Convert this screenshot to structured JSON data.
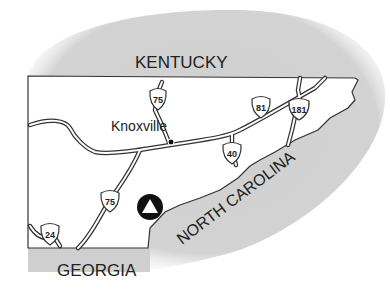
{
  "map": {
    "states": {
      "north": "KENTUCKY",
      "south": "GEORGIA",
      "east": "NORTH CAROLINA"
    },
    "city": {
      "name": "Knoxville"
    },
    "highways": [
      {
        "id": "i75-north",
        "number": "75"
      },
      {
        "id": "i81",
        "number": "81"
      },
      {
        "id": "i181",
        "number": "181"
      },
      {
        "id": "i40",
        "number": "40"
      },
      {
        "id": "i75-south",
        "number": "75"
      },
      {
        "id": "i24",
        "number": "24"
      }
    ],
    "marker": {
      "type": "triangle-in-circle"
    },
    "colors": {
      "shade": "#cfcfcf",
      "land": "#ffffff",
      "line": "#333333",
      "text": "#222222"
    }
  }
}
